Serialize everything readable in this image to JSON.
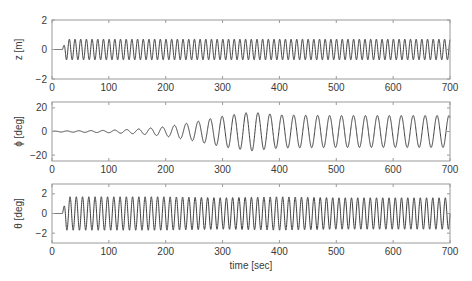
{
  "chart_data": [
    {
      "type": "line",
      "title": "",
      "ylabel": "z [m]",
      "xlabel": "",
      "xlim": [
        0,
        700
      ],
      "ylim": [
        -2,
        2
      ],
      "xticks": [
        0,
        100,
        200,
        300,
        400,
        500,
        600,
        700
      ],
      "yticks": [
        -2,
        0,
        2
      ],
      "ytick_labels": [
        "−2",
        "0",
        "2"
      ],
      "grid": false,
      "series": [
        {
          "name": "z",
          "description": "heave response: flat at 0 until ~t=18 s, then steady sinusoidal oscillation",
          "start_time": 18,
          "period_sec": 10,
          "amplitude_start": 0.7,
          "amplitude_end": 0.7,
          "x": [
            0,
            18,
            25,
            100,
            200,
            300,
            400,
            500,
            600,
            700
          ],
          "envelope_upper": [
            0,
            0,
            0.7,
            0.7,
            0.7,
            0.7,
            0.7,
            0.7,
            0.7,
            0.7
          ],
          "envelope_lower": [
            0,
            0,
            -0.7,
            -0.7,
            -0.7,
            -0.7,
            -0.7,
            -0.7,
            -0.7,
            -0.7
          ]
        }
      ]
    },
    {
      "type": "line",
      "title": "",
      "ylabel": "ϕ [deg]",
      "xlabel": "",
      "xlim": [
        0,
        700
      ],
      "ylim": [
        -25,
        25
      ],
      "xticks": [
        0,
        100,
        200,
        300,
        400,
        500,
        600,
        700
      ],
      "yticks": [
        -20,
        0,
        20
      ],
      "ytick_labels": [
        "−20",
        "0",
        "20"
      ],
      "grid": false,
      "series": [
        {
          "name": "phi",
          "description": "roll response: slowly growing oscillation, peaks ~17 deg near t=360 s, then settles to ~14 deg amplitude",
          "start_time": 0,
          "period_sec": 21,
          "x": [
            0,
            100,
            150,
            200,
            250,
            300,
            350,
            400,
            500,
            600,
            700
          ],
          "envelope_upper": [
            0.3,
            1.0,
            2.0,
            4.0,
            8.0,
            13.0,
            16.5,
            14.0,
            13.5,
            13.5,
            13.5
          ],
          "envelope_lower": [
            -0.3,
            -1.0,
            -2.0,
            -4.0,
            -8.0,
            -13.0,
            -16.5,
            -14.0,
            -13.5,
            -13.5,
            -13.5
          ]
        }
      ]
    },
    {
      "type": "line",
      "title": "",
      "ylabel": "θ [deg]",
      "xlabel": "time [sec]",
      "xlim": [
        0,
        700
      ],
      "ylim": [
        -3,
        3
      ],
      "xticks": [
        0,
        100,
        200,
        300,
        400,
        500,
        600,
        700
      ],
      "yticks": [
        -2,
        0,
        2
      ],
      "ytick_labels": [
        "−2",
        "0",
        "2"
      ],
      "grid": false,
      "series": [
        {
          "name": "theta",
          "description": "pitch response: flat at 0 until ~t=18 s, then steady sinusoidal oscillation",
          "start_time": 18,
          "period_sec": 11,
          "x": [
            0,
            18,
            25,
            100,
            200,
            300,
            400,
            500,
            600,
            700
          ],
          "envelope_upper": [
            0,
            0,
            1.7,
            1.7,
            1.7,
            1.6,
            1.7,
            1.6,
            1.6,
            1.6
          ],
          "envelope_lower": [
            0,
            0,
            -1.7,
            -1.7,
            -1.7,
            -1.6,
            -1.7,
            -1.6,
            -1.6,
            -1.6
          ]
        }
      ]
    }
  ],
  "colors": {
    "line": "#3c3c3c",
    "axes": "#9a9a9a",
    "text": "#3a3a3a",
    "background": "#ffffff"
  }
}
